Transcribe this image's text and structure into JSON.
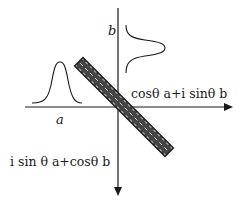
{
  "diagram": {
    "type": "beam-splitter",
    "colors": {
      "ink": "#1a1a1a",
      "splitter_fill": "#444444",
      "splitter_stripe": "#e8e8e8"
    },
    "labels": {
      "input_a": "a",
      "input_b": "b",
      "output_horizontal": "cosθ a+i sinθ b",
      "output_vertical": "i sin θ a+cosθ b"
    },
    "axes": {
      "horizontal": {
        "from": [
          25,
          107
        ],
        "to": [
          232,
          107
        ],
        "arrow": "right"
      },
      "vertical": {
        "from": [
          118,
          8
        ],
        "to": [
          118,
          195
        ],
        "arrow": "down"
      }
    },
    "wavepackets": [
      {
        "name": "a",
        "orientation": "upward",
        "peak": [
          60,
          62
        ],
        "base_y": 103
      },
      {
        "name": "b",
        "orientation": "rightward",
        "peak": [
          165,
          48
        ],
        "base_x": 126
      }
    ],
    "splitter": {
      "from": [
        80,
        62
      ],
      "to": [
        168,
        152
      ],
      "angle_deg": 45
    }
  }
}
